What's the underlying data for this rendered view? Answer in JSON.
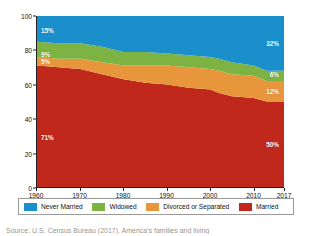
{
  "chart_data": {
    "type": "area",
    "stacked": true,
    "title": "",
    "subtitle": "",
    "xlabel": "",
    "ylabel": "Percent of Population",
    "xlim": [
      1960,
      2017
    ],
    "ylim": [
      0,
      100
    ],
    "grid": false,
    "legend_position": "bottom",
    "x": [
      1960,
      1965,
      1970,
      1975,
      1980,
      1985,
      1990,
      1995,
      2000,
      2002,
      2005,
      2010,
      2013,
      2017
    ],
    "xticks": [
      "1960",
      "1970",
      "1980",
      "1990",
      "2000",
      "2010",
      "2017"
    ],
    "xtick_values": [
      1960,
      1970,
      1980,
      1990,
      2000,
      2010,
      2017
    ],
    "yticks": [
      "0",
      "20",
      "40",
      "60",
      "80",
      "100"
    ],
    "ytick_values": [
      0,
      20,
      40,
      60,
      80,
      100
    ],
    "series": [
      {
        "name": "Married",
        "color": "#c0281c",
        "stack_order": 1,
        "values": [
          71,
          70,
          69,
          66,
          63,
          61,
          60,
          58,
          57,
          55,
          53,
          52,
          50,
          50
        ],
        "start_label": "71%",
        "end_label": "50%"
      },
      {
        "name": "Divorced or Separated",
        "color": "#e8963c",
        "stack_order": 2,
        "values": [
          5,
          5,
          6,
          7,
          8,
          10,
          11,
          12,
          12,
          13,
          13,
          13,
          12,
          12
        ],
        "start_label": "5%",
        "end_label": "12%"
      },
      {
        "name": "Widowed",
        "color": "#7cb342",
        "stack_order": 3,
        "values": [
          9,
          9,
          9,
          9,
          8,
          8,
          7,
          7,
          7,
          7,
          7,
          6,
          6,
          6
        ],
        "start_label": "9%",
        "end_label": "6%"
      },
      {
        "name": "Never Married",
        "color": "#1a8fcc",
        "stack_order": 4,
        "values": [
          15,
          16,
          16,
          18,
          21,
          21,
          22,
          23,
          24,
          25,
          27,
          29,
          32,
          32
        ],
        "start_label": "15%",
        "end_label": "32%"
      }
    ]
  },
  "axis": {
    "ylabel": "Percent of Population",
    "yticks": [
      "100",
      "80",
      "60",
      "40",
      "20",
      "0"
    ],
    "xticks": [
      "1960",
      "1970",
      "1980",
      "1990",
      "2000",
      "2010",
      "2017"
    ]
  },
  "labels": {
    "never_married_start": "15%",
    "never_married_end": "32%",
    "widowed_start": "9%",
    "widowed_end": "6%",
    "divorced_start": "5%",
    "divorced_end": "12%",
    "married_start": "71%",
    "married_end": "50%"
  },
  "legend": {
    "items": [
      {
        "label": "Never Married",
        "color": "#1a8fcc"
      },
      {
        "label": "Widowed",
        "color": "#7cb342"
      },
      {
        "label": "Divorced or Separated",
        "color": "#e8963c"
      },
      {
        "label": "Married",
        "color": "#c0281c"
      }
    ]
  },
  "caption": {
    "text": "Source: U.S. Census Bureau (2017). America's families and living"
  },
  "colors": {
    "never_married": "#1a8fcc",
    "widowed": "#7cb342",
    "divorced_or_separated": "#e8963c",
    "married": "#c0281c",
    "axis": "#222222",
    "text": "#111111"
  }
}
